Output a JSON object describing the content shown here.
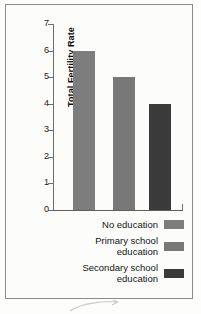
{
  "chart_data": {
    "type": "bar",
    "title": "",
    "xlabel": "",
    "ylabel": "Total Fertility Rate",
    "categories": [
      "No education",
      "Primary school education",
      "Secondary school education"
    ],
    "values": [
      6,
      5,
      4
    ],
    "ylim": [
      0,
      7
    ],
    "yticks": [
      7,
      6,
      5,
      4,
      3,
      2,
      1,
      0
    ],
    "ytick_labels": [
      "7",
      "6",
      "5",
      "4",
      "3",
      "2",
      "1",
      "0"
    ],
    "grid": false,
    "legend_position": "below-plot-right-aligned",
    "series": [
      {
        "name": "Total Fertility Rate",
        "values": [
          6,
          5,
          4
        ],
        "colors": [
          "#7d7d7d",
          "#787878",
          "#3a3a3a"
        ]
      }
    ]
  },
  "axis": {
    "y_title": "Total Fertility Rate",
    "ticks": [
      "7",
      "6",
      "5",
      "4",
      "3",
      "2",
      "1",
      "0"
    ]
  },
  "legend": {
    "items": [
      {
        "label": "No education",
        "color": "#7d7d7d"
      },
      {
        "label": "Primary school\neducation",
        "color": "#787878"
      },
      {
        "label": "Secondary school\neducation",
        "color": "#3a3a3a"
      }
    ]
  },
  "colors": {
    "bar_no_education": "#7d7d7d",
    "bar_primary_school": "#787878",
    "bar_secondary_school": "#3a3a3a",
    "axis": "#6e6e6e",
    "frame": "#8b8b8b",
    "text": "#141414",
    "background": "#fcfcfb"
  }
}
